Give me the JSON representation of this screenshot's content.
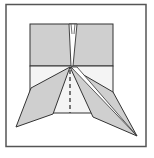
{
  "diagram": {
    "type": "origami-fold-step",
    "colors": {
      "paper_colored": "#cfcfcf",
      "paper_white": "#f4f4f4",
      "line": "#333333",
      "frame": "#555555",
      "background": "#ffffff"
    },
    "elements": [
      "outer-frame",
      "upper-colored-panel",
      "lower-white-panel",
      "center-slit",
      "left-flap",
      "right-flap",
      "valley-fold-dashed-line"
    ]
  }
}
